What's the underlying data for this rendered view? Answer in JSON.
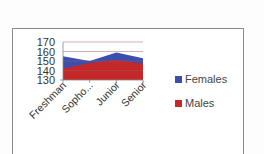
{
  "chart_data": {
    "type": "area",
    "stacked": false,
    "title": "",
    "xlabel": "",
    "ylabel": "",
    "categories": [
      "Freshman",
      "Sopho...",
      "Junior",
      "Senior"
    ],
    "series": [
      {
        "name": "Females",
        "color": "#3b4fb0",
        "values": [
          155,
          150,
          159,
          153
        ]
      },
      {
        "name": "Males",
        "color": "#c42828",
        "values": [
          142,
          148,
          151,
          147
        ]
      }
    ],
    "ylim": [
      130,
      170
    ],
    "yticks": [
      "170",
      "160",
      "150",
      "140",
      "130"
    ],
    "grid": true,
    "legend_position": "right"
  },
  "legend": {
    "items": [
      {
        "label": "Females",
        "color": "#3b4fb0"
      },
      {
        "label": "Males",
        "color": "#c42828"
      }
    ]
  }
}
